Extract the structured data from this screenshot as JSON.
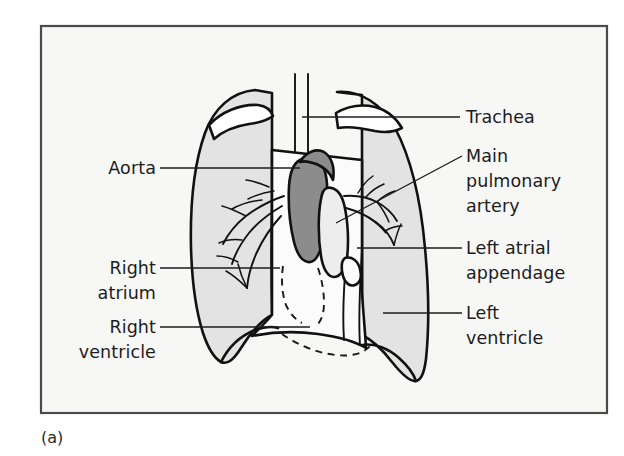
{
  "figure": {
    "caption": "(a)",
    "background_color": "#ffffff",
    "panel_color": "#f7f7f6",
    "frame_color": "#4a4a4a",
    "ink_color": "#111111",
    "lung_fill_color": "#e3e3e3",
    "aorta_fill_color": "#8c8c8c",
    "pulmonary_artery_fill_color": "#ededed",
    "heart_fill_color": "#fbfbfb",
    "clavicle_fill_color": "#ffffff"
  },
  "labels": {
    "left": [
      {
        "id": "aorta",
        "text": "Aorta"
      },
      {
        "id": "right-atrium-line1",
        "text": "Right"
      },
      {
        "id": "right-atrium-line2",
        "text": "atrium"
      },
      {
        "id": "right-ventricle-line1",
        "text": "Right"
      },
      {
        "id": "right-ventricle-line2",
        "text": "ventricle"
      }
    ],
    "right": [
      {
        "id": "trachea",
        "text": "Trachea"
      },
      {
        "id": "main-pulmonary-artery-line1",
        "text": "Main"
      },
      {
        "id": "main-pulmonary-artery-line2",
        "text": "pulmonary"
      },
      {
        "id": "main-pulmonary-artery-line3",
        "text": "artery"
      },
      {
        "id": "left-atrial-appendage-line1",
        "text": "Left atrial"
      },
      {
        "id": "left-atrial-appendage-line2",
        "text": "appendage"
      },
      {
        "id": "left-ventricle-line1",
        "text": "Left"
      },
      {
        "id": "left-ventricle-line2",
        "text": "ventricle"
      }
    ]
  },
  "structures": [
    {
      "id": "trachea",
      "name": "Trachea"
    },
    {
      "id": "aorta",
      "name": "Aorta"
    },
    {
      "id": "main-pulmonary-artery",
      "name": "Main pulmonary artery"
    },
    {
      "id": "left-atrial-appendage",
      "name": "Left atrial appendage"
    },
    {
      "id": "left-ventricle",
      "name": "Left ventricle"
    },
    {
      "id": "right-atrium",
      "name": "Right atrium"
    },
    {
      "id": "right-ventricle",
      "name": "Right ventricle"
    },
    {
      "id": "right-lung",
      "name": "Right lung"
    },
    {
      "id": "left-lung",
      "name": "Left lung"
    },
    {
      "id": "clavicles",
      "name": "Clavicles"
    },
    {
      "id": "hilar-vessels",
      "name": "Hilar pulmonary vessels"
    },
    {
      "id": "hidden-cardiac-border",
      "name": "Cardiac border behind diaphragm"
    }
  ]
}
